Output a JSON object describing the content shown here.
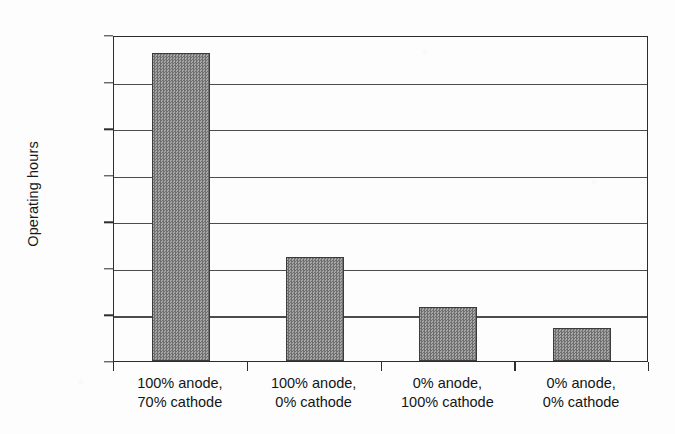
{
  "chart_data": {
    "type": "bar",
    "title": "",
    "xlabel": "",
    "ylabel": "Operating hours",
    "categories": [
      "100% anode, 70% cathode",
      "100% anode, 0% cathode",
      "0% anode, 100% cathode",
      "0% anode, 0% cathode"
    ],
    "category_lines": [
      [
        "100% anode,",
        "70% cathode"
      ],
      [
        "100% anode,",
        "0% cathode"
      ],
      [
        "0% anode,",
        "100% cathode"
      ],
      [
        "0% anode,",
        "0% cathode"
      ]
    ],
    "values": [
      3310,
      1115,
      580,
      350
    ],
    "ylim": [
      0,
      3500
    ],
    "ytick_values": [
      0,
      500,
      1000,
      1500,
      2000,
      2500,
      3000,
      3500
    ],
    "ytick_labels": [
      "0",
      "500",
      "1000",
      "1500",
      "2000",
      "2500",
      "3000",
      "3500"
    ],
    "grid": true,
    "legend": "none",
    "bar_color": "#8a8a8a",
    "bar_edge_color": "#3a3c3e",
    "axis_color": "#2a2c2e",
    "background_color": "#fdfdfd"
  }
}
